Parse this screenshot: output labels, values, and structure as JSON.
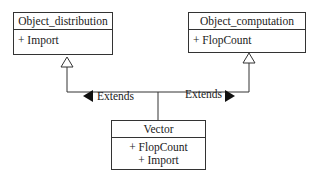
{
  "diagram": {
    "type": "uml-class-diagram",
    "classes": [
      {
        "id": "object_distribution",
        "name": "Object_distribution",
        "members": [
          "+ Import"
        ]
      },
      {
        "id": "object_computation",
        "name": "Object_computation",
        "members": [
          "+ FlopCount"
        ]
      },
      {
        "id": "vector",
        "name": "Vector",
        "members": [
          "+ FlopCount",
          "+ Import"
        ]
      }
    ],
    "relations": [
      {
        "from": "vector",
        "to": "object_distribution",
        "type": "generalization",
        "label": "Extends",
        "arrow_direction": "left"
      },
      {
        "from": "vector",
        "to": "object_computation",
        "type": "generalization",
        "label": "Extends",
        "arrow_direction": "right"
      }
    ]
  }
}
